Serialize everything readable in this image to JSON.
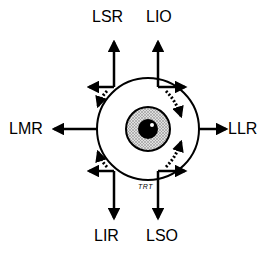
{
  "diagram": {
    "labels": {
      "top_left": "LSR",
      "top_right": "LIO",
      "left": "LMR",
      "right": "LLR",
      "bottom_left": "LIR",
      "bottom_right": "LSO",
      "small_annotation": "TRT"
    },
    "muscles": [
      {
        "abbr": "LSR",
        "primary_direction": "up",
        "secondary_direction": "in",
        "torsion": "intorsion"
      },
      {
        "abbr": "LIO",
        "primary_direction": "up",
        "secondary_direction": "out",
        "torsion": "extorsion"
      },
      {
        "abbr": "LMR",
        "primary_direction": "in"
      },
      {
        "abbr": "LLR",
        "primary_direction": "out"
      },
      {
        "abbr": "LIR",
        "primary_direction": "down",
        "secondary_direction": "in",
        "torsion": "extorsion"
      },
      {
        "abbr": "LSO",
        "primary_direction": "down",
        "secondary_direction": "out",
        "torsion": "intorsion"
      }
    ],
    "colors": {
      "stroke": "#000000",
      "background": "#ffffff",
      "iris_fill": "#c8c8c8"
    }
  }
}
